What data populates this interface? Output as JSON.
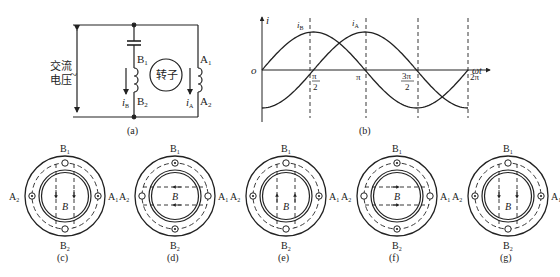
{
  "circuit": {
    "caption": "(a)",
    "voltage_label_line1": "交流",
    "voltage_label_line2": "电压",
    "ac_symbol": "~",
    "rotor_label": "转子",
    "coil_b": {
      "top": "B",
      "top_sub": "1",
      "bottom": "B",
      "bottom_sub": "2",
      "current": "i",
      "current_sub": "B"
    },
    "coil_a": {
      "top": "A",
      "top_sub": "1",
      "bottom": "A",
      "bottom_sub": "2",
      "current": "i",
      "current_sub": "A"
    }
  },
  "waveform": {
    "caption": "(b)",
    "y_axis_label": "i",
    "x_axis_label": "ωt",
    "origin_label": "o",
    "curve_labels": [
      {
        "text": "i",
        "sub": "B"
      },
      {
        "text": "i",
        "sub": "A"
      }
    ],
    "ticks": [
      {
        "num": "π",
        "den": "2"
      },
      {
        "num": "π",
        "den": ""
      },
      {
        "num": "3π",
        "den": "2"
      },
      {
        "num": "2π",
        "den": ""
      }
    ]
  },
  "chart_data": {
    "type": "line",
    "xlabel": "ωt",
    "ylabel": "i",
    "x": [
      "0",
      "π/2",
      "π",
      "3π/2",
      "2π"
    ],
    "series": [
      {
        "name": "i_B",
        "values": [
          0,
          1,
          0,
          -1,
          0
        ]
      },
      {
        "name": "i_A",
        "values": [
          -1,
          0,
          1,
          0,
          -1
        ]
      }
    ],
    "grid": "dashed vertical lines at π/2, π, 3π/2, 2π"
  },
  "stator_diagrams": [
    {
      "caption": "(c)",
      "top": "B",
      "top_sub": "1",
      "bottom": "B",
      "bottom_sub": "2",
      "left": "A",
      "left_sub": "2",
      "right": "A",
      "right_sub": "1",
      "field_label": "B",
      "field_direction": "down"
    },
    {
      "caption": "(d)",
      "top": "B",
      "top_sub": "1",
      "bottom": "B",
      "bottom_sub": "2",
      "left": "A",
      "left_sub": "2",
      "right": "A",
      "right_sub": "1",
      "field_label": "B",
      "field_direction": "left"
    },
    {
      "caption": "(e)",
      "top": "B",
      "top_sub": "1",
      "bottom": "B",
      "bottom_sub": "2",
      "left": "A",
      "left_sub": "2",
      "right": "A",
      "right_sub": "1",
      "field_label": "B",
      "field_direction": "up"
    },
    {
      "caption": "(f)",
      "top": "B",
      "top_sub": "1",
      "bottom": "B",
      "bottom_sub": "2",
      "left": "A",
      "left_sub": "2",
      "right": "A",
      "right_sub": "1",
      "field_label": "B",
      "field_direction": "right"
    },
    {
      "caption": "(g)",
      "top": "B",
      "top_sub": "1",
      "bottom": "B",
      "bottom_sub": "2",
      "left": "A",
      "left_sub": "2",
      "right": "A",
      "right_sub": "1",
      "field_label": "B",
      "field_direction": "down"
    }
  ]
}
